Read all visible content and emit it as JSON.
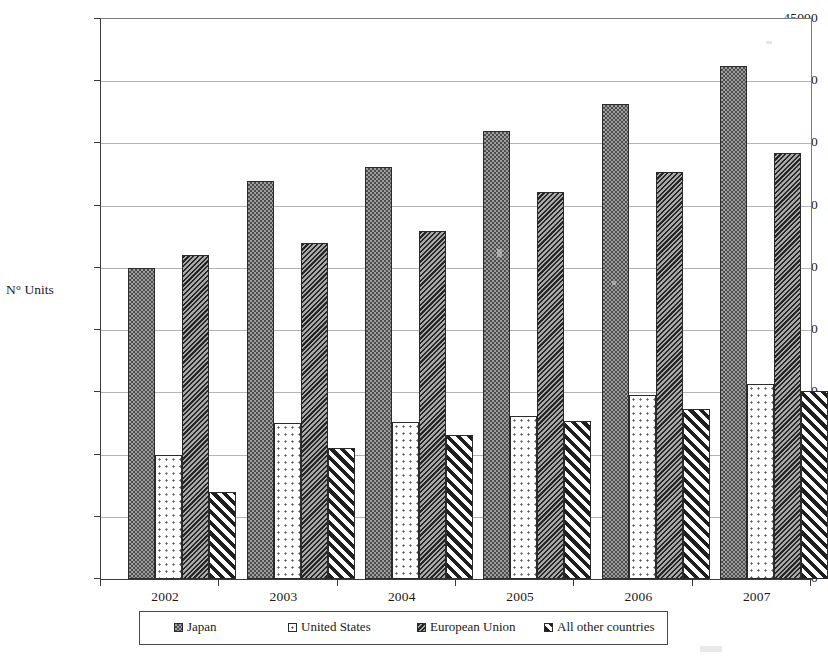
{
  "chart_data": {
    "type": "bar",
    "title": "",
    "xlabel": "",
    "ylabel": "N° Units",
    "ylim": [
      0,
      45000
    ],
    "ytick_step": 5000,
    "yticks": [
      "45000",
      "40000",
      "35000",
      "30000",
      "25000",
      "20000",
      "15000",
      "10000",
      "5000",
      "0"
    ],
    "grid": true,
    "legend_position": "bottom",
    "categories": [
      "2002",
      "2003",
      "2004",
      "2005",
      "2006",
      "2007"
    ],
    "series": [
      {
        "name": "Japan",
        "pattern": "dark-checker",
        "color": "#9e9e9e",
        "values": [
          25000,
          32000,
          33100,
          36000,
          38200,
          41200
        ]
      },
      {
        "name": "United States",
        "pattern": "light-dots",
        "color": "#ffffff",
        "values": [
          10000,
          12500,
          12600,
          13100,
          14800,
          15700
        ]
      },
      {
        "name": "European Union",
        "pattern": "dense-diagonal-hatch",
        "color": "#5a5a5a",
        "values": [
          26000,
          27000,
          28000,
          31100,
          32700,
          34200
        ]
      },
      {
        "name": "All other countries",
        "pattern": "bold-diagonal-stripes",
        "color": "#ffffff",
        "values": [
          7000,
          10500,
          11600,
          12700,
          13700,
          15100
        ]
      }
    ]
  }
}
